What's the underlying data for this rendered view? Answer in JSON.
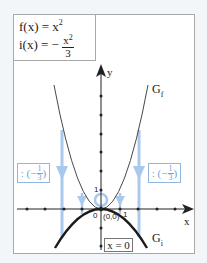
{
  "formulas": {
    "f": {
      "lhs": "f(x) = x",
      "exp": "2"
    },
    "i": {
      "lhs": "i(x) = −",
      "num_base": "x",
      "num_exp": "2",
      "den": "3"
    }
  },
  "axes": {
    "x_label": "x",
    "y_label": "y",
    "tick_one_x": "1",
    "tick_one_y": "1",
    "origin_zero": "0"
  },
  "graph_labels": {
    "gf": "G",
    "gf_sub": "f",
    "gi": "G",
    "gi_sub": "i"
  },
  "origin_point": "(0,0)",
  "symmetry_axis": "x = 0",
  "scale_boxes": {
    "left": {
      "prefix": ": (−",
      "num": "1",
      "den": "3",
      "suffix": ")"
    },
    "right": {
      "prefix": ": (−",
      "num": "1",
      "den": "3",
      "suffix": ")"
    }
  },
  "colors": {
    "curve": "#222222",
    "arrow": "#a9c9ec",
    "box_border": "#8fb7e0",
    "box_text": "#6fa3d8",
    "frame": "#a8a8a8"
  }
}
